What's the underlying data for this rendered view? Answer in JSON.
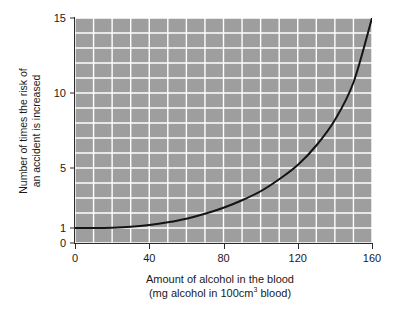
{
  "chart_data": {
    "type": "line",
    "title": "",
    "xlabel": "Amount of alcohol in the blood",
    "xlabel_line2_pre": "(mg alcohol in 100cm",
    "xlabel_line2_sup": "3",
    "xlabel_line2_post": " blood)",
    "ylabel_line1": "Number of times the risk of",
    "ylabel_line2": "an accident is increased",
    "xlim": [
      0,
      160
    ],
    "ylim": [
      0,
      15
    ],
    "x_ticks": [
      "0",
      "40",
      "80",
      "120",
      "160"
    ],
    "x_tick_values": [
      0,
      40,
      80,
      120,
      160
    ],
    "y_ticks": [
      "0",
      "1",
      "5",
      "10",
      "15"
    ],
    "y_tick_values": [
      0,
      1,
      5,
      10,
      15
    ],
    "grid": true,
    "grid_x_step": 10,
    "grid_y_step": 1,
    "legend": "none",
    "series": [
      {
        "name": "Relative risk of accident",
        "x": [
          0,
          10,
          20,
          30,
          40,
          50,
          60,
          70,
          80,
          90,
          100,
          110,
          120,
          130,
          140,
          150,
          160
        ],
        "values": [
          1.0,
          1.0,
          1.02,
          1.08,
          1.2,
          1.38,
          1.62,
          1.95,
          2.35,
          2.85,
          3.45,
          4.25,
          5.2,
          6.5,
          8.2,
          10.7,
          15.0
        ]
      }
    ],
    "colors": {
      "plot_background": "#9e9e9e",
      "gridline": "#ffffff",
      "curve": "#141414",
      "axis": "#2b2b2b",
      "text": "#1a1a1a",
      "page_background": "#ffffff"
    }
  }
}
